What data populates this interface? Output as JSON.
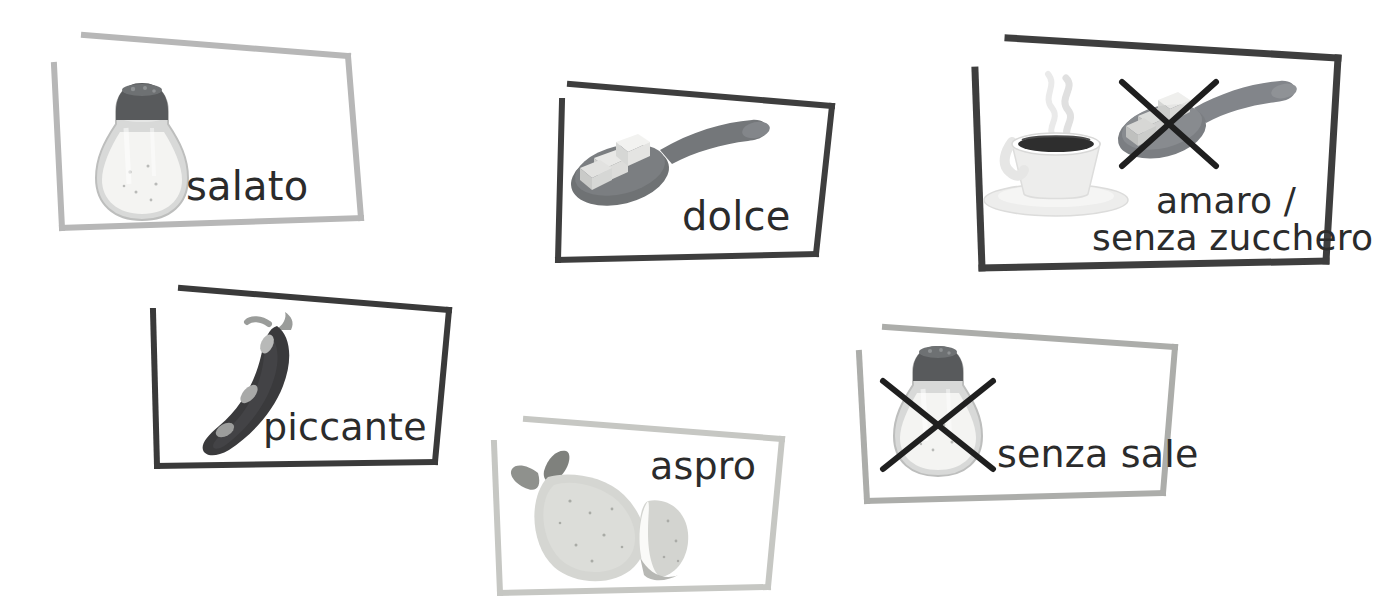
{
  "page": {
    "language": "it",
    "background_color": "#ffffff",
    "width": 1376,
    "height": 615
  },
  "palette": {
    "frame_dark": "#3a3a3a",
    "frame_light": "#b3b3b3",
    "text": "#2b2b2b",
    "cross_mark": "#1f1f1f",
    "shaker_cap": "#585a5c",
    "shaker_body": "#d9dada",
    "shaker_salt": "#f2f2f0",
    "spoon": "#6f7274",
    "sugar_cube": "#ededeb",
    "chili_body": "#3a3a3c",
    "chili_stem": "#9a9c9a",
    "lemon_body": "#d5d6d2",
    "lemon_leaf": "#8f918d",
    "cup_body": "#ededec",
    "coffee": "#2e2e2e",
    "steam": "#e2e2e2"
  },
  "cards": [
    {
      "id": "salato",
      "label": "salato",
      "label_lines": [
        "salato"
      ],
      "frame_style": "light",
      "frame_color": "#b3b3b3",
      "icons": [
        "salt-shaker"
      ],
      "crossed_out": false
    },
    {
      "id": "dolce",
      "label": "dolce",
      "label_lines": [
        "dolce"
      ],
      "frame_style": "dark",
      "frame_color": "#3a3a3a",
      "icons": [
        "spoon-with-sugar-cubes"
      ],
      "crossed_out": false
    },
    {
      "id": "amaro-senza-zucchero",
      "label": "amaro / senza zucchero",
      "label_lines": [
        "amaro /",
        "senza zucchero"
      ],
      "frame_style": "dark",
      "frame_color": "#3a3a3a",
      "icons": [
        "coffee-cup",
        "spoon-with-sugar-cubes"
      ],
      "crossed_out": true
    },
    {
      "id": "piccante",
      "label": "piccante",
      "label_lines": [
        "piccante"
      ],
      "frame_style": "dark",
      "frame_color": "#3a3a3a",
      "icons": [
        "chili-pepper"
      ],
      "crossed_out": false
    },
    {
      "id": "aspro",
      "label": "aspro",
      "label_lines": [
        "aspro"
      ],
      "frame_style": "light",
      "frame_color": "#c3c4c0",
      "icons": [
        "lemon",
        "lemon-half"
      ],
      "crossed_out": false
    },
    {
      "id": "senza-sale",
      "label": "senza sale",
      "label_lines": [
        "senza sale"
      ],
      "frame_style": "light",
      "frame_color": "#a9aaa8",
      "icons": [
        "salt-shaker"
      ],
      "crossed_out": true
    }
  ]
}
